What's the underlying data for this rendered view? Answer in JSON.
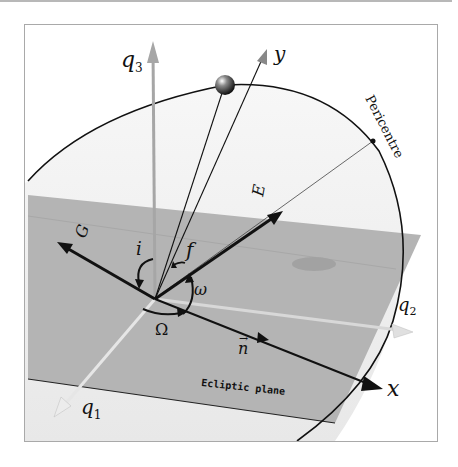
{
  "figure": {
    "colors": {
      "background": "#ffffff",
      "frame_border": "#a9a9a9",
      "orbital_plane": "#ededed",
      "ecliptic_plane": "#b3b3b3",
      "dark_vector": "#111111",
      "gray_axis": "#a6a6a6",
      "light_axis": "#e4e4e4"
    }
  },
  "labels": {
    "q1": "q",
    "q1_sub": "1",
    "q2": "q",
    "q2_sub": "2",
    "q3": "q",
    "q3_sub": "3",
    "x_axis": "x",
    "y_axis": "y",
    "n_vector": "n",
    "e_vector": "E",
    "g_vector": "G",
    "inclination": "i",
    "true_anomaly": "f",
    "arg_pericentre": "ω",
    "long_ascending_node": "Ω",
    "pericentre": "Pericentre",
    "ecliptic_plane": "Ecliptic plane"
  },
  "elements": [
    {
      "symbol": "i",
      "meaning": "inclination"
    },
    {
      "symbol": "Ω",
      "meaning": "longitude of ascending node"
    },
    {
      "symbol": "ω",
      "meaning": "argument of pericentre"
    },
    {
      "symbol": "f",
      "meaning": "true anomaly"
    }
  ]
}
